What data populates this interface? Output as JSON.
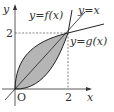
{
  "diagram": {
    "type": "function-graph",
    "axes": {
      "x_label": "x",
      "y_label": "y",
      "origin_label": "O"
    },
    "ticks": {
      "x_tick": "2",
      "y_tick": "2"
    },
    "curves": [
      {
        "name": "f",
        "label": "y=f(x)",
        "description": "concave curve above y=x on [0,2], steeper past x=2"
      },
      {
        "name": "line",
        "label": "y=x",
        "description": "line through origin"
      },
      {
        "name": "g",
        "label": "y=g(x)",
        "description": "convex curve below y=x on [0,2], flatter past x=2"
      }
    ],
    "intersection": {
      "x": 2,
      "y": 2
    },
    "shaded_region": "between y=f(x) and y=g(x) for 0 ≤ x ≤ 2",
    "colors": {
      "shade": "#b5b5b5",
      "stroke": "#222222",
      "dashed": "#555555"
    }
  }
}
